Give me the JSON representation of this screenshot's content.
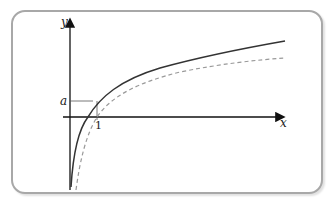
{
  "diagram": {
    "type": "function-graph",
    "axes": {
      "x_label": "x",
      "y_label": "y"
    },
    "labels": {
      "x_tick": "1",
      "y_mark": "a"
    },
    "curves": [
      {
        "name": "solid-curve",
        "style": "solid",
        "color": "#333333"
      },
      {
        "name": "dashed-curve",
        "style": "dashed",
        "color": "#999999"
      }
    ],
    "frame": {
      "border_color": "#a8a8a8",
      "background": "#ffffff"
    }
  }
}
